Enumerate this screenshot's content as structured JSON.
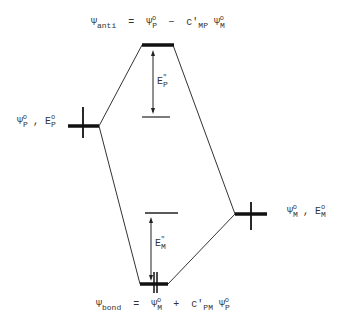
{
  "diagram": {
    "type": "molecular orbital energy level diagram",
    "levels": {
      "anti": {
        "label_main": "Ψ",
        "label_sub": "anti",
        "equation": "= Ψ_P^o − c'_MP Ψ_M^o"
      },
      "bond": {
        "label_main": "Ψ",
        "label_sub": "bond",
        "equation": "= Ψ_M^o + c'_PM Ψ_P^o"
      },
      "left": {
        "label": "Ψ_P^o , E_P^o"
      },
      "right": {
        "label": "Ψ_M^o , E_M^o"
      }
    },
    "energy_gaps": {
      "upper": "E_P\"",
      "lower": "E_M\""
    },
    "text": {
      "psi": "Ψ",
      "anti": "anti",
      "bond": "bond",
      "eq": "=",
      "minus": "−",
      "plus": "+",
      "P": "P",
      "M": "M",
      "o": "o",
      "c": "c'",
      "MP": "MP",
      "PM": "PM",
      "E": "E",
      "comma": ",",
      "dq": "\""
    }
  }
}
